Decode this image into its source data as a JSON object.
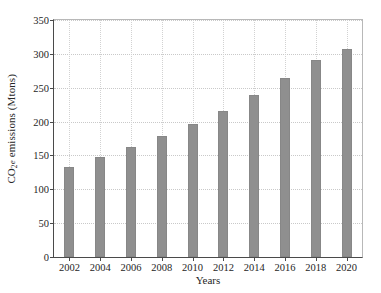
{
  "chart_data": {
    "type": "bar",
    "title": "",
    "subtitle": "",
    "xlabel": "Years",
    "ylabel_plain": "CO2e emissions (Mtons)",
    "ylabel_parts": {
      "prefix": "CO",
      "sub": "2",
      "sub_suffix": "e",
      "rest": " emissions (Mtons)"
    },
    "categories": [
      "2002",
      "2004",
      "2006",
      "2008",
      "2010",
      "2012",
      "2014",
      "2016",
      "2018",
      "2020"
    ],
    "values": [
      133,
      147,
      162,
      178,
      196,
      216,
      240,
      265,
      291,
      307
    ],
    "xtick_labels": [
      "2002",
      "2004",
      "2006",
      "2008",
      "2010",
      "2012",
      "2014",
      "2016",
      "2018",
      "2020"
    ],
    "ytick_labels": [
      "0",
      "50",
      "100",
      "150",
      "200",
      "250",
      "300",
      "350"
    ],
    "ytick_values": [
      0,
      50,
      100,
      150,
      200,
      250,
      300,
      350
    ],
    "ylim": [
      0,
      350
    ],
    "xlim_categories": 10,
    "grid": true,
    "grid_style": "dotted",
    "legend": null,
    "legend_position": "none",
    "bar_color": "#8f8f8f",
    "grid_color": "#c9c9c9",
    "axis_color": "#4a4a4a",
    "background_color": "#ffffff"
  }
}
